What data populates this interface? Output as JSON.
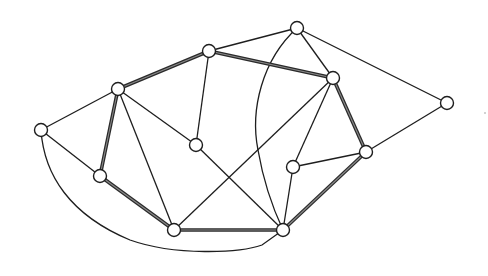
{
  "diagram": {
    "type": "graph",
    "nodes": [
      {
        "id": "A"
      },
      {
        "id": "B"
      },
      {
        "id": "C"
      },
      {
        "id": "D"
      },
      {
        "id": "E"
      },
      {
        "id": "F"
      },
      {
        "id": "G"
      },
      {
        "id": "H"
      },
      {
        "id": "I"
      },
      {
        "id": "J"
      },
      {
        "id": "K"
      },
      {
        "id": "L"
      }
    ],
    "edges": [
      {
        "from": "B",
        "to": "C",
        "style": "bold"
      },
      {
        "from": "C",
        "to": "E",
        "style": "bold"
      },
      {
        "from": "E",
        "to": "I",
        "style": "bold"
      },
      {
        "from": "I",
        "to": "L",
        "style": "bold"
      },
      {
        "from": "L",
        "to": "K",
        "style": "bold"
      },
      {
        "from": "K",
        "to": "J",
        "style": "bold"
      },
      {
        "from": "J",
        "to": "B",
        "style": "bold"
      },
      {
        "from": "A",
        "to": "B",
        "style": "thin"
      },
      {
        "from": "A",
        "to": "J",
        "style": "thin"
      },
      {
        "from": "A",
        "to": "L",
        "style": "thin",
        "shape": "curve"
      },
      {
        "from": "B",
        "to": "G",
        "style": "thin"
      },
      {
        "from": "B",
        "to": "K",
        "style": "thin"
      },
      {
        "from": "C",
        "to": "D",
        "style": "thin"
      },
      {
        "from": "C",
        "to": "G",
        "style": "thin"
      },
      {
        "from": "D",
        "to": "E",
        "style": "thin"
      },
      {
        "from": "D",
        "to": "F",
        "style": "thin"
      },
      {
        "from": "D",
        "to": "L",
        "style": "thin",
        "shape": "curve"
      },
      {
        "from": "E",
        "to": "K",
        "style": "thin"
      },
      {
        "from": "E",
        "to": "H",
        "style": "thin"
      },
      {
        "from": "F",
        "to": "I",
        "style": "thin"
      },
      {
        "from": "G",
        "to": "L",
        "style": "thin"
      },
      {
        "from": "H",
        "to": "I",
        "style": "thin"
      },
      {
        "from": "H",
        "to": "L",
        "style": "thin"
      }
    ]
  }
}
